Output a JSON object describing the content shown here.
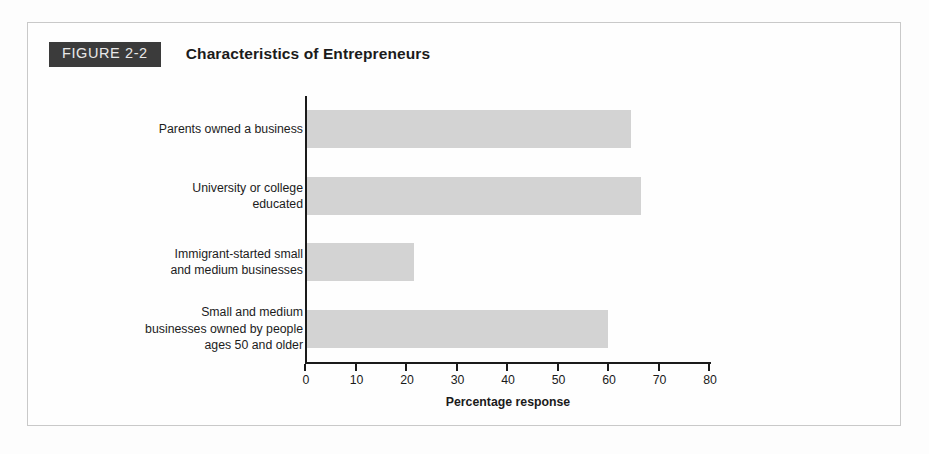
{
  "figure": {
    "badge_label": "FIGURE 2-2",
    "title": "Characteristics of Entrepreneurs"
  },
  "colors": {
    "badge_background": "#3b3b3b",
    "badge_text": "#e8e8e8",
    "bar_fill": "#d3d3d3",
    "axis": "#1a1a1a",
    "page_background": "#fefefe",
    "frame_border": "#c9c9c9"
  },
  "chart_data": {
    "type": "bar",
    "orientation": "horizontal",
    "title": "Characteristics of Entrepreneurs",
    "subtitle": "",
    "xlabel": "Percentage response",
    "ylabel": "",
    "categories": [
      "Parents owned a business",
      "University or college\neducated",
      "Immigrant-started small\nand medium businesses",
      "Small and medium\nbusinesses owned by people\nages 50 and older"
    ],
    "values": [
      64.5,
      66.5,
      21.5,
      60
    ],
    "xlim": [
      0,
      80
    ],
    "ylim": null,
    "xticks": [
      0,
      10,
      20,
      30,
      40,
      50,
      60,
      70,
      80
    ],
    "xtick_labels": [
      "0",
      "10",
      "20",
      "30",
      "40",
      "50",
      "60",
      "70",
      "80"
    ],
    "grid": false,
    "legend": null,
    "legend_position": "none",
    "annotations": []
  }
}
